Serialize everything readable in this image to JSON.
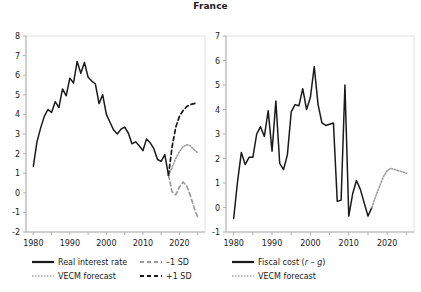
{
  "title": "France",
  "colors": {
    "line": "#1a1a1a",
    "forecast_gray": "#9a9a9a",
    "axis": "#b0b0b0",
    "text": "#1a1a1a"
  },
  "chart_data": [
    {
      "type": "line",
      "panel": "left",
      "title": "France",
      "xlabel": "",
      "ylabel": "",
      "xlim": [
        1978,
        2027
      ],
      "ylim": [
        -2,
        8
      ],
      "yticks": [
        -2,
        -1,
        0,
        1,
        2,
        3,
        4,
        5,
        6,
        7,
        8
      ],
      "ytick_labels": [
        "-2",
        "-1",
        "0",
        "1",
        "2",
        "3",
        "4",
        "5",
        "6",
        "7",
        "8"
      ],
      "xticks": [
        1980,
        1985,
        1990,
        1995,
        2000,
        2005,
        2010,
        2015,
        2020,
        2025
      ],
      "xtick_labels": [
        "1980",
        "",
        "1990",
        "",
        "2000",
        "",
        "2010",
        "",
        "2020",
        ""
      ],
      "grid": false,
      "legend_position": "bottom-left",
      "series": [
        {
          "name": "Real interest rate",
          "style": "solid",
          "color": "#1a1a1a",
          "x": [
            1980,
            1981,
            1982,
            1983,
            1984,
            1985,
            1986,
            1987,
            1988,
            1989,
            1990,
            1991,
            1992,
            1993,
            1994,
            1995,
            1996,
            1997,
            1998,
            1999,
            2000,
            2001,
            2002,
            2003,
            2004,
            2005,
            2006,
            2007,
            2008,
            2009,
            2010,
            2011,
            2012,
            2013,
            2014,
            2015,
            2016,
            2017
          ],
          "y": [
            1.35,
            2.6,
            3.3,
            3.9,
            4.25,
            4.1,
            4.65,
            4.35,
            5.3,
            4.95,
            5.85,
            5.6,
            6.7,
            6.1,
            6.65,
            5.9,
            5.7,
            5.55,
            4.55,
            5.0,
            4.0,
            3.6,
            3.2,
            3.0,
            3.25,
            3.35,
            3.05,
            2.5,
            2.6,
            2.4,
            2.15,
            2.75,
            2.55,
            2.25,
            1.7,
            1.6,
            1.95,
            0.9
          ]
        },
        {
          "name": "VECM forecast",
          "style": "dotted",
          "color": "#9a9a9a",
          "x": [
            2017,
            2018,
            2019,
            2020,
            2021,
            2022,
            2023,
            2024,
            2025
          ],
          "y": [
            0.9,
            1.3,
            1.75,
            2.1,
            2.35,
            2.45,
            2.4,
            2.2,
            2.05
          ]
        },
        {
          "name": "-1 SD",
          "style": "dashed",
          "color": "#9a9a9a",
          "x": [
            2017,
            2018,
            2019,
            2020,
            2021,
            2022,
            2023,
            2024,
            2025
          ],
          "y": [
            0.9,
            0.05,
            -0.1,
            0.3,
            0.55,
            0.35,
            -0.15,
            -0.75,
            -1.25
          ]
        },
        {
          "name": "+1 SD",
          "style": "dashed",
          "color": "#1a1a1a",
          "x": [
            2017,
            2018,
            2019,
            2020,
            2021,
            2022,
            2023,
            2024,
            2025
          ],
          "y": [
            0.9,
            2.35,
            3.35,
            3.9,
            4.2,
            4.4,
            4.5,
            4.55,
            4.6
          ]
        }
      ]
    },
    {
      "type": "line",
      "panel": "right",
      "title": "",
      "xlabel": "",
      "ylabel": "",
      "xlim": [
        1978,
        2027
      ],
      "ylim": [
        -1,
        7
      ],
      "yticks": [
        -1,
        0,
        1,
        2,
        3,
        4,
        5,
        6,
        7
      ],
      "ytick_labels": [
        "-1",
        "0",
        "1",
        "2",
        "3",
        "4",
        "5",
        "6",
        "7"
      ],
      "xticks": [
        1980,
        1985,
        1990,
        1995,
        2000,
        2005,
        2010,
        2015,
        2020,
        2025
      ],
      "xtick_labels": [
        "1980",
        "",
        "1990",
        "",
        "2000",
        "",
        "2010",
        "",
        "2020",
        ""
      ],
      "grid": false,
      "legend_position": "bottom-center",
      "series": [
        {
          "name": "Fiscal cost (r - g)",
          "style": "solid",
          "color": "#1a1a1a",
          "x": [
            1980,
            1981,
            1982,
            1983,
            1984,
            1985,
            1986,
            1987,
            1988,
            1989,
            1990,
            1991,
            1992,
            1993,
            1994,
            1995,
            1996,
            1997,
            1998,
            1999,
            2000,
            2001,
            2002,
            2003,
            2004,
            2005,
            2006,
            2007,
            2008,
            2009,
            2010,
            2011,
            2012,
            2013,
            2014,
            2015,
            2016
          ],
          "y": [
            -0.45,
            1.05,
            2.25,
            1.75,
            2.05,
            2.05,
            3.0,
            3.3,
            2.9,
            3.95,
            2.3,
            4.35,
            1.8,
            1.55,
            2.15,
            3.9,
            4.2,
            4.15,
            4.85,
            4.0,
            4.5,
            5.75,
            4.2,
            3.45,
            3.35,
            3.4,
            3.45,
            0.25,
            0.3,
            5.0,
            -0.35,
            0.55,
            1.1,
            0.75,
            0.2,
            -0.35,
            0.0
          ]
        },
        {
          "name": "VECM forecast",
          "style": "dotted",
          "color": "#9a9a9a",
          "x": [
            2016,
            2017,
            2018,
            2019,
            2020,
            2021,
            2022,
            2023,
            2024,
            2025
          ],
          "y": [
            0.0,
            0.45,
            0.85,
            1.25,
            1.5,
            1.6,
            1.55,
            1.5,
            1.45,
            1.4
          ]
        }
      ]
    }
  ],
  "legend": {
    "left": [
      {
        "label": "Real interest rate",
        "style": "solid",
        "color": "#1a1a1a"
      },
      {
        "label": "VECM forecast",
        "style": "dotted",
        "color": "#9a9a9a"
      },
      {
        "label": "–1 SD",
        "style": "dashed",
        "color": "#9a9a9a"
      },
      {
        "label": "+1 SD",
        "style": "dashed",
        "color": "#1a1a1a"
      }
    ],
    "right": [
      {
        "label_pre": "Fiscal cost (",
        "label_r": "r",
        "label_mid": " – ",
        "label_g": "g",
        "label_post": ")",
        "style": "solid",
        "color": "#1a1a1a"
      },
      {
        "label": "VECM forecast",
        "style": "dotted",
        "color": "#9a9a9a"
      }
    ]
  }
}
